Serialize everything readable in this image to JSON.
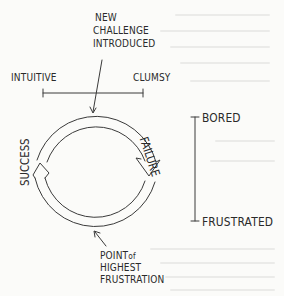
{
  "diagram": {
    "top_label": [
      "NEW",
      "CHALLENGE",
      "INTRODUCED"
    ],
    "horizontal_scale": {
      "left": "INTUITIVE",
      "right": "CLUMSY"
    },
    "cycle": {
      "right_label": "FAILURE",
      "left_label": "SUCCESS"
    },
    "vertical_scale": {
      "top": "BORED",
      "bottom": "FRUSTRATED"
    },
    "bottom_label": {
      "line1_a": "POINT",
      "line1_b": "of",
      "line2": "HIGHEST",
      "line3": "FRUSTRATION"
    },
    "colors": {
      "ink": "#2a2a2a",
      "paper": "#fbfbf9"
    }
  }
}
